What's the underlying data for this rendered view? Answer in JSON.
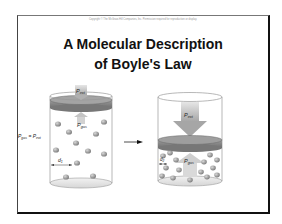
{
  "slide": {
    "copyright": "Copyright © The McGraw-Hill Companies, Inc. Permission required for reproduction or display.",
    "title_line1": "A Molecular Description",
    "title_line2": "of Boyle's Law"
  },
  "diagram": {
    "left_cylinder": {
      "p_ext_label": "P",
      "p_ext_sub": "ext",
      "p_gas_label": "P",
      "p_gas_sub": "gas",
      "equality_label": "P",
      "equality_sub1": "gas",
      "equality_mid": " = P",
      "equality_sub2": "ext",
      "distance_label": "d",
      "distance_sub": "1"
    },
    "right_cylinder": {
      "p_ext_label": "P",
      "p_ext_sub": "ext",
      "p_gas_label": "P",
      "p_gas_sub": "gas",
      "distance_label": "d",
      "distance_sub": "2"
    },
    "transition_arrow": "arrow-right-icon",
    "colors": {
      "piston": "#8a8a8a",
      "piston_top": "#a8a8a8",
      "cylinder_outline": "#888888",
      "molecule": "#9a9a9a",
      "pressure_arrow": "#bdbdbd"
    }
  }
}
